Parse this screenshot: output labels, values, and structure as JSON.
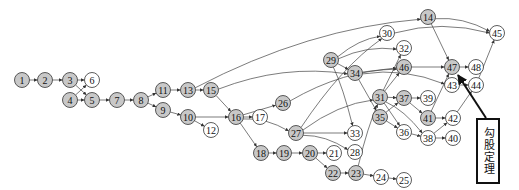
{
  "diagram": {
    "type": "directed-graph",
    "colors": {
      "gray": "#c8c8c8",
      "white": "#ffffff",
      "stroke": "#333333"
    },
    "callout": {
      "label": "勾股定理",
      "target": "47"
    },
    "nodes": [
      {
        "id": "1",
        "x": 22,
        "y": 80,
        "fill": "gray"
      },
      {
        "id": "2",
        "x": 45,
        "y": 80,
        "fill": "gray"
      },
      {
        "id": "3",
        "x": 70,
        "y": 80,
        "fill": "gray"
      },
      {
        "id": "6",
        "x": 92,
        "y": 80,
        "fill": "white"
      },
      {
        "id": "4",
        "x": 70,
        "y": 100,
        "fill": "gray"
      },
      {
        "id": "5",
        "x": 92,
        "y": 100,
        "fill": "gray"
      },
      {
        "id": "7",
        "x": 117,
        "y": 100,
        "fill": "gray"
      },
      {
        "id": "8",
        "x": 141,
        "y": 100,
        "fill": "gray"
      },
      {
        "id": "11",
        "x": 163,
        "y": 90,
        "fill": "gray"
      },
      {
        "id": "9",
        "x": 163,
        "y": 110,
        "fill": "gray"
      },
      {
        "id": "13",
        "x": 188,
        "y": 90,
        "fill": "gray"
      },
      {
        "id": "15",
        "x": 211,
        "y": 90,
        "fill": "gray"
      },
      {
        "id": "10",
        "x": 188,
        "y": 117,
        "fill": "gray"
      },
      {
        "id": "12",
        "x": 211,
        "y": 130,
        "fill": "white"
      },
      {
        "id": "16",
        "x": 236,
        "y": 117,
        "fill": "gray"
      },
      {
        "id": "17",
        "x": 260,
        "y": 117,
        "fill": "white"
      },
      {
        "id": "26",
        "x": 283,
        "y": 103,
        "fill": "gray"
      },
      {
        "id": "27",
        "x": 296,
        "y": 133,
        "fill": "gray"
      },
      {
        "id": "18",
        "x": 261,
        "y": 153,
        "fill": "gray"
      },
      {
        "id": "19",
        "x": 284,
        "y": 153,
        "fill": "gray"
      },
      {
        "id": "20",
        "x": 310,
        "y": 153,
        "fill": "gray"
      },
      {
        "id": "21",
        "x": 334,
        "y": 153,
        "fill": "white"
      },
      {
        "id": "22",
        "x": 333,
        "y": 173,
        "fill": "gray"
      },
      {
        "id": "23",
        "x": 356,
        "y": 173,
        "fill": "gray"
      },
      {
        "id": "24",
        "x": 381,
        "y": 177,
        "fill": "white"
      },
      {
        "id": "25",
        "x": 404,
        "y": 180,
        "fill": "white"
      },
      {
        "id": "28",
        "x": 355,
        "y": 152,
        "fill": "white"
      },
      {
        "id": "33",
        "x": 355,
        "y": 133,
        "fill": "white"
      },
      {
        "id": "29",
        "x": 331,
        "y": 60,
        "fill": "gray"
      },
      {
        "id": "30",
        "x": 387,
        "y": 33,
        "fill": "white"
      },
      {
        "id": "32",
        "x": 404,
        "y": 48,
        "fill": "white"
      },
      {
        "id": "34",
        "x": 355,
        "y": 73,
        "fill": "gray"
      },
      {
        "id": "46",
        "x": 404,
        "y": 67,
        "fill": "gray"
      },
      {
        "id": "31",
        "x": 380,
        "y": 97,
        "fill": "gray"
      },
      {
        "id": "37",
        "x": 404,
        "y": 98,
        "fill": "gray"
      },
      {
        "id": "39",
        "x": 428,
        "y": 98,
        "fill": "white"
      },
      {
        "id": "35",
        "x": 380,
        "y": 117,
        "fill": "gray"
      },
      {
        "id": "36",
        "x": 404,
        "y": 132,
        "fill": "white"
      },
      {
        "id": "38",
        "x": 428,
        "y": 138,
        "fill": "white"
      },
      {
        "id": "40",
        "x": 453,
        "y": 138,
        "fill": "white"
      },
      {
        "id": "41",
        "x": 428,
        "y": 118,
        "fill": "gray"
      },
      {
        "id": "42",
        "x": 453,
        "y": 118,
        "fill": "white"
      },
      {
        "id": "14",
        "x": 428,
        "y": 17,
        "fill": "gray"
      },
      {
        "id": "45",
        "x": 497,
        "y": 33,
        "fill": "white"
      },
      {
        "id": "47",
        "x": 452,
        "y": 67,
        "fill": "gray"
      },
      {
        "id": "48",
        "x": 476,
        "y": 67,
        "fill": "white"
      },
      {
        "id": "43",
        "x": 452,
        "y": 85,
        "fill": "white"
      },
      {
        "id": "44",
        "x": 476,
        "y": 85,
        "fill": "white"
      }
    ],
    "edges": [
      [
        "1",
        "2"
      ],
      [
        "2",
        "3"
      ],
      [
        "3",
        "6"
      ],
      [
        "3",
        "5"
      ],
      [
        "4",
        "6"
      ],
      [
        "4",
        "5"
      ],
      [
        "5",
        "7"
      ],
      [
        "7",
        "8"
      ],
      [
        "8",
        "11"
      ],
      [
        "8",
        "9"
      ],
      [
        "11",
        "13"
      ],
      [
        "13",
        "15"
      ],
      [
        "13",
        "14"
      ],
      [
        "9",
        "10"
      ],
      [
        "10",
        "16"
      ],
      [
        "10",
        "12"
      ],
      [
        "15",
        "16"
      ],
      [
        "15",
        "34"
      ],
      [
        "16",
        "17"
      ],
      [
        "16",
        "26"
      ],
      [
        "16",
        "27"
      ],
      [
        "16",
        "18"
      ],
      [
        "18",
        "19"
      ],
      [
        "19",
        "20"
      ],
      [
        "20",
        "21"
      ],
      [
        "20",
        "22"
      ],
      [
        "22",
        "23"
      ],
      [
        "23",
        "24"
      ],
      [
        "24",
        "25"
      ],
      [
        "23",
        "31"
      ],
      [
        "26",
        "46"
      ],
      [
        "27",
        "30"
      ],
      [
        "27",
        "31"
      ],
      [
        "27",
        "33"
      ],
      [
        "27",
        "28"
      ],
      [
        "29",
        "30"
      ],
      [
        "29",
        "32"
      ],
      [
        "29",
        "34"
      ],
      [
        "29",
        "33"
      ],
      [
        "34",
        "46"
      ],
      [
        "34",
        "43"
      ],
      [
        "34",
        "35"
      ],
      [
        "31",
        "32"
      ],
      [
        "31",
        "46"
      ],
      [
        "31",
        "37"
      ],
      [
        "31",
        "38"
      ],
      [
        "31",
        "36"
      ],
      [
        "35",
        "37"
      ],
      [
        "35",
        "36"
      ],
      [
        "37",
        "39"
      ],
      [
        "37",
        "41"
      ],
      [
        "36",
        "38"
      ],
      [
        "38",
        "40"
      ],
      [
        "38",
        "42"
      ],
      [
        "41",
        "42"
      ],
      [
        "41",
        "47"
      ],
      [
        "46",
        "47"
      ],
      [
        "47",
        "48"
      ],
      [
        "43",
        "44"
      ],
      [
        "44",
        "45"
      ],
      [
        "42",
        "44"
      ],
      [
        "14",
        "45"
      ],
      [
        "14",
        "47"
      ],
      [
        "30",
        "45"
      ]
    ]
  }
}
